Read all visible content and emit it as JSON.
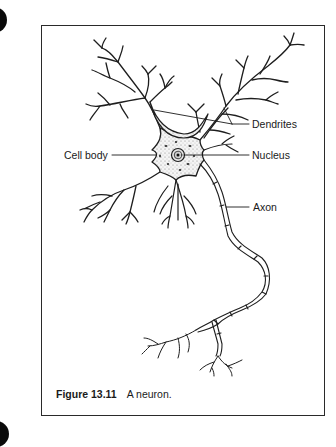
{
  "figure": {
    "caption_number": "Figure 13.11",
    "caption_text": "A neuron."
  },
  "labels": {
    "dendrites": "Dendrites",
    "cell_body": "Cell body",
    "nucleus": "Nucleus",
    "axon": "Axon"
  },
  "colors": {
    "ink": "#1a1a1a",
    "background": "#ffffff"
  }
}
